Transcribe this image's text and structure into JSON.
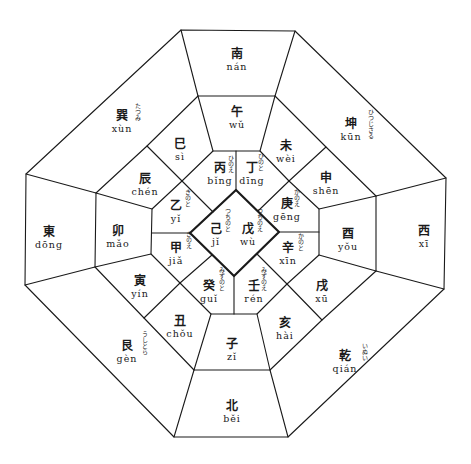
{
  "colors": {
    "line": "#1a1a1a",
    "background": "#ffffff"
  },
  "outer_ring": [
    {
      "id": "nan",
      "kanji": "南",
      "pinyin": "nán",
      "furigana": "",
      "x": 237,
      "y": 60
    },
    {
      "id": "kun",
      "kanji": "坤",
      "pinyin": "kūn",
      "furigana": "ひつじさる",
      "x": 351,
      "y": 130
    },
    {
      "id": "xi",
      "kanji": "西",
      "pinyin": "xī",
      "furigana": "",
      "x": 424,
      "y": 237
    },
    {
      "id": "qian",
      "kanji": "乾",
      "pinyin": "qián",
      "furigana": "いぬい",
      "x": 345,
      "y": 362
    },
    {
      "id": "bei",
      "kanji": "北",
      "pinyin": "běi",
      "furigana": "",
      "x": 232,
      "y": 412
    },
    {
      "id": "gen",
      "kanji": "艮",
      "pinyin": "gèn",
      "furigana": "うしとら",
      "x": 127,
      "y": 352
    },
    {
      "id": "dong",
      "kanji": "東",
      "pinyin": "dōng",
      "furigana": "",
      "x": 49,
      "y": 238
    },
    {
      "id": "xun",
      "kanji": "巽",
      "pinyin": "xùn",
      "furigana": "たつみ",
      "x": 122,
      "y": 122
    }
  ],
  "middle_ring": [
    {
      "id": "wu",
      "kanji": "午",
      "pinyin": "wǔ",
      "x": 237,
      "y": 118
    },
    {
      "id": "wei",
      "kanji": "未",
      "pinyin": "wèi",
      "x": 286,
      "y": 152
    },
    {
      "id": "shen",
      "kanji": "申",
      "pinyin": "shēn",
      "x": 326,
      "y": 184
    },
    {
      "id": "you",
      "kanji": "酉",
      "pinyin": "yǒu",
      "x": 348,
      "y": 240
    },
    {
      "id": "xu",
      "kanji": "戌",
      "pinyin": "xū",
      "x": 322,
      "y": 292
    },
    {
      "id": "hai",
      "kanji": "亥",
      "pinyin": "hài",
      "x": 285,
      "y": 329
    },
    {
      "id": "zi",
      "kanji": "子",
      "pinyin": "zǐ",
      "x": 232,
      "y": 350
    },
    {
      "id": "chou",
      "kanji": "丑",
      "pinyin": "chǒu",
      "x": 180,
      "y": 327
    },
    {
      "id": "yin",
      "kanji": "寅",
      "pinyin": "yín",
      "x": 140,
      "y": 287
    },
    {
      "id": "mao",
      "kanji": "卯",
      "pinyin": "mǎo",
      "x": 118,
      "y": 237
    },
    {
      "id": "chen",
      "kanji": "辰",
      "pinyin": "chén",
      "x": 145,
      "y": 185
    },
    {
      "id": "si",
      "kanji": "巳",
      "pinyin": "sì",
      "x": 180,
      "y": 150
    }
  ],
  "inner_ring": [
    {
      "id": "bing",
      "kanji": "丙",
      "pinyin": "bǐng",
      "furigana": "ひのえ",
      "x": 222,
      "y": 174
    },
    {
      "id": "ding",
      "kanji": "丁",
      "pinyin": "dīng",
      "furigana": "ひのと",
      "x": 255,
      "y": 174
    },
    {
      "id": "geng",
      "kanji": "庚",
      "pinyin": "gēng",
      "furigana": "かのえ",
      "x": 289,
      "y": 210
    },
    {
      "id": "xin",
      "kanji": "辛",
      "pinyin": "xīn",
      "furigana": "かのと",
      "x": 290,
      "y": 254
    },
    {
      "id": "ren",
      "kanji": "壬",
      "pinyin": "rén",
      "furigana": "みずのえ",
      "x": 255,
      "y": 292
    },
    {
      "id": "gui",
      "kanji": "癸",
      "pinyin": "guǐ",
      "furigana": "みずのと",
      "x": 211,
      "y": 292
    },
    {
      "id": "jia",
      "kanji": "甲",
      "pinyin": "jiǎ",
      "furigana": "きのえ",
      "x": 178,
      "y": 254
    },
    {
      "id": "yi",
      "kanji": "乙",
      "pinyin": "yǐ",
      "furigana": "きのと",
      "x": 178,
      "y": 212
    }
  ],
  "center": [
    {
      "id": "ji",
      "kanji": "己",
      "pinyin": "jǐ",
      "furigana": "つちのと",
      "x": 218,
      "y": 235
    },
    {
      "id": "wu_stem",
      "kanji": "戊",
      "pinyin": "wù",
      "furigana": "つちのえ",
      "x": 249,
      "y": 235
    }
  ]
}
